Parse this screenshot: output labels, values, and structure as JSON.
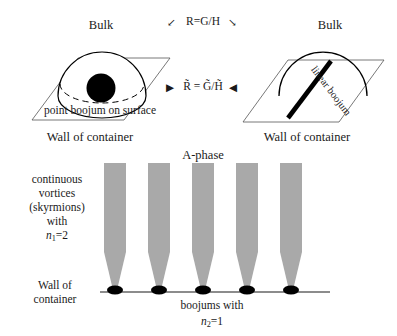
{
  "figure": {
    "top_left_panel": {
      "bulk_label": "Bulk",
      "surface_label": "point boojum on surface",
      "wall_label": "Wall of container"
    },
    "top_right_panel": {
      "bulk_label": "Bulk",
      "defect_label": "linear boojum",
      "wall_label": "Wall of container"
    },
    "relations": {
      "top_formula": "R=G/H",
      "bottom_formula": "R̃ = G̃/H̃",
      "top_arrow_left": "↙",
      "top_arrow_right": "↘",
      "bottom_arrow_left": "▶",
      "bottom_arrow_right": "◀"
    },
    "bottom_panel": {
      "phase_label": "A-phase",
      "vortices_caption_lines": [
        "continuous",
        "vortices",
        "(skyrmions)",
        "with"
      ],
      "vortices_index_base": "n",
      "vortices_index_sub": "1",
      "vortices_index_value": "=2",
      "wall_label_lines": [
        "Wall of",
        "container"
      ],
      "boojums_caption": "boojums with",
      "boojums_index_base": "n",
      "boojums_index_sub": "2",
      "boojums_index_value": "=1",
      "column_count": 5
    },
    "colors": {
      "ink": "#1a1a1a",
      "line": "#000000",
      "column_gray": "#a9a9a9",
      "wall_gray": "#8c8c8c",
      "background": "#ffffff"
    }
  }
}
